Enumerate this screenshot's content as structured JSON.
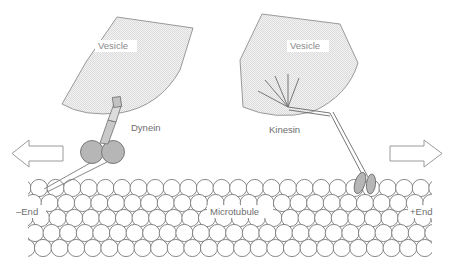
{
  "figure": {
    "background": "#ffffff"
  },
  "labels": {
    "vesicle_left": "Vesicle",
    "vesicle_right": "Vesicle",
    "dynein": "Dynein",
    "kinesin": "Kinesin",
    "microtubule": "Microtubule",
    "minus_end": "–End",
    "plus_end": "+End"
  },
  "colors": {
    "vesicle_fill": "#ececec",
    "vesicle_stroke": "#8f8f8f",
    "motor_fill": "#b6b6b6",
    "motor_stroke": "#6f6f6f",
    "tubulin_fill": "#ffffff",
    "tubulin_stroke": "#7c7c7c",
    "arrow_stroke": "#9a9a9a",
    "text": "#8a8a8a",
    "stalk_fill": "#d8d8d8"
  },
  "structures": {
    "vesicle_left": {
      "name": "Vesicle",
      "shape": "fan-wedge",
      "position": "upper-left"
    },
    "vesicle_right": {
      "name": "Vesicle",
      "shape": "fan-wedge",
      "position": "upper-right"
    },
    "dynein": {
      "name": "Dynein",
      "heads": 2,
      "head_shape": "circle",
      "direction": "minus-end",
      "attached_to": "vesicle_left"
    },
    "kinesin": {
      "name": "Kinesin",
      "heads": 2,
      "head_shape": "oval",
      "tail_filaments": 5,
      "direction": "plus-end",
      "attached_to": "vesicle_right"
    },
    "microtubule": {
      "name": "Microtubule",
      "subunit": "tubulin",
      "rows": 5,
      "minus_end_side": "left",
      "plus_end_side": "right"
    }
  },
  "arrows": {
    "left": {
      "name": "minus-end-direction-arrow",
      "direction": "left"
    },
    "right": {
      "name": "plus-end-direction-arrow",
      "direction": "right"
    }
  }
}
